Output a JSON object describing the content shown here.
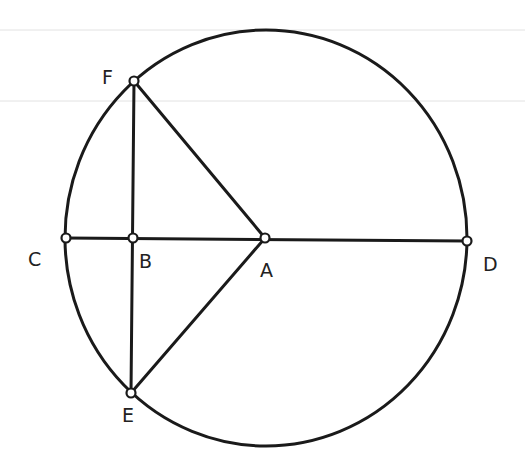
{
  "diagram": {
    "type": "geometry-circle-construction",
    "circle": {
      "center": "A",
      "cx": 266,
      "cy": 238,
      "rx": 201,
      "ry": 208
    },
    "points": [
      {
        "id": "A",
        "label": "A",
        "x": 265,
        "y": 238
      },
      {
        "id": "B",
        "label": "B",
        "x": 133,
        "y": 238
      },
      {
        "id": "C",
        "label": "C",
        "x": 66,
        "y": 238
      },
      {
        "id": "D",
        "label": "D",
        "x": 467,
        "y": 241
      },
      {
        "id": "E",
        "label": "E",
        "x": 131,
        "y": 393
      },
      {
        "id": "F",
        "label": "F",
        "x": 134,
        "y": 81
      }
    ],
    "segments": [
      {
        "from": "C",
        "to": "D",
        "name": "diameter-CD"
      },
      {
        "from": "F",
        "to": "E",
        "name": "chord-FE"
      },
      {
        "from": "F",
        "to": "A",
        "name": "radius-FA"
      },
      {
        "from": "E",
        "to": "A",
        "name": "radius-EA"
      }
    ],
    "labels": {
      "A": "A",
      "B": "B",
      "C": "C",
      "D": "D",
      "E": "E",
      "F": "F"
    }
  }
}
